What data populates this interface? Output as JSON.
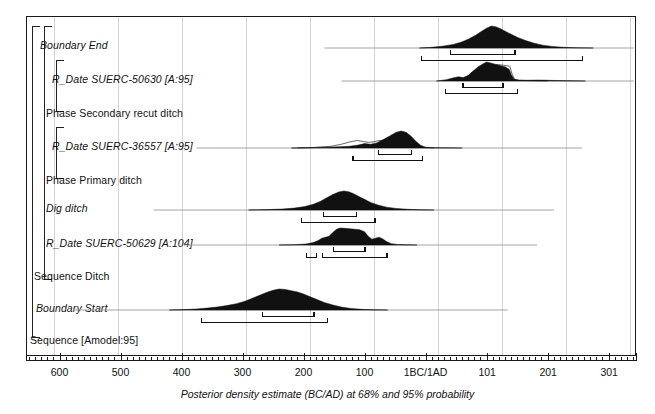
{
  "chart_data": {
    "type": "area",
    "title": "",
    "xlabel": "Posterior density estimate (BC/AD) at 68% and 95% probability",
    "ylabel": "",
    "axis": {
      "orientation": "reversed-bc-to-ad",
      "tick_labels": [
        "600",
        "500",
        "400",
        "300",
        "200",
        "100",
        "1BC/1AD",
        "101",
        "201",
        "301"
      ],
      "tick_values": [
        -600,
        -500,
        -400,
        -300,
        -200,
        -100,
        0,
        101,
        201,
        301
      ],
      "minor_tick_step": 10,
      "x_min": -655,
      "x_max": 345,
      "grid": true
    },
    "legend": {
      "position": "none",
      "entries": []
    },
    "rows": [
      {
        "id": "boundary-end",
        "label": "Boundary End",
        "style": "italic",
        "kind": "boundary",
        "density": [
          [
            -10,
            0
          ],
          [
            10,
            0.03
          ],
          [
            30,
            0.09
          ],
          [
            45,
            0.16
          ],
          [
            58,
            0.26
          ],
          [
            70,
            0.4
          ],
          [
            82,
            0.58
          ],
          [
            92,
            0.76
          ],
          [
            100,
            0.9
          ],
          [
            108,
            1.0
          ],
          [
            116,
            0.96
          ],
          [
            124,
            0.86
          ],
          [
            132,
            0.74
          ],
          [
            142,
            0.6
          ],
          [
            152,
            0.47
          ],
          [
            164,
            0.34
          ],
          [
            178,
            0.22
          ],
          [
            192,
            0.13
          ],
          [
            208,
            0.07
          ],
          [
            226,
            0.03
          ],
          [
            248,
            0.01
          ],
          [
            275,
            0.0
          ]
        ],
        "range68": [
          [
            40,
            148
          ]
        ],
        "range95": [
          [
            -8,
            258
          ]
        ]
      },
      {
        "id": "r-date-suerc-50630",
        "label": "R_Date SUERC-50630 [A:95]",
        "style": "italic",
        "kind": "r_date",
        "density": [
          [
            18,
            0
          ],
          [
            34,
            0.07
          ],
          [
            46,
            0.17
          ],
          [
            54,
            0.22
          ],
          [
            62,
            0.18
          ],
          [
            70,
            0.3
          ],
          [
            78,
            0.52
          ],
          [
            86,
            0.74
          ],
          [
            94,
            0.9
          ],
          [
            100,
            1.0
          ],
          [
            108,
            0.94
          ],
          [
            116,
            0.86
          ],
          [
            124,
            0.8
          ],
          [
            131,
            0.74
          ],
          [
            137,
            0.62
          ],
          [
            141,
            0.3
          ],
          [
            145,
            0.1
          ],
          [
            152,
            0.05
          ],
          [
            168,
            0.04
          ],
          [
            186,
            0.05
          ],
          [
            200,
            0.04
          ],
          [
            218,
            0.02
          ],
          [
            240,
            0.01
          ],
          [
            262,
            0
          ]
        ],
        "prior_outline": [
          [
            60,
            0
          ],
          [
            70,
            0.25
          ],
          [
            80,
            0.5
          ],
          [
            90,
            0.72
          ],
          [
            100,
            0.86
          ],
          [
            110,
            0.88
          ],
          [
            120,
            0.86
          ],
          [
            130,
            0.82
          ],
          [
            138,
            0.78
          ],
          [
            142,
            0.36
          ],
          [
            146,
            0.08
          ],
          [
            154,
            0.03
          ],
          [
            170,
            0.02
          ],
          [
            200,
            0
          ]
        ],
        "range68": [
          [
            60,
            128
          ]
        ],
        "range95": [
          [
            32,
            152
          ]
        ]
      },
      {
        "id": "phase-secondary-recut-ditch",
        "label": "Phase Secondary recut ditch",
        "style": "plain",
        "kind": "group",
        "density": [],
        "range68": [],
        "range95": []
      },
      {
        "id": "r-date-suerc-36557",
        "label": "R_Date SUERC-36557 [A:95]",
        "style": "italic",
        "kind": "r_date",
        "density": [
          [
            -220,
            0
          ],
          [
            -190,
            0.02
          ],
          [
            -160,
            0.05
          ],
          [
            -140,
            0.08
          ],
          [
            -125,
            0.1
          ],
          [
            -112,
            0.16
          ],
          [
            -100,
            0.26
          ],
          [
            -90,
            0.22
          ],
          [
            -80,
            0.3
          ],
          [
            -70,
            0.48
          ],
          [
            -58,
            0.72
          ],
          [
            -48,
            0.92
          ],
          [
            -40,
            1.0
          ],
          [
            -32,
            0.92
          ],
          [
            -24,
            0.7
          ],
          [
            -16,
            0.4
          ],
          [
            -8,
            0.16
          ],
          [
            0,
            0.05
          ],
          [
            12,
            0.02
          ],
          [
            30,
            0.01
          ],
          [
            60,
            0
          ]
        ],
        "prior_outline": [
          [
            -210,
            0
          ],
          [
            -180,
            0.04
          ],
          [
            -155,
            0.1
          ],
          [
            -138,
            0.22
          ],
          [
            -124,
            0.36
          ],
          [
            -112,
            0.44
          ],
          [
            -102,
            0.38
          ],
          [
            -94,
            0.33
          ],
          [
            -86,
            0.36
          ],
          [
            -78,
            0.42
          ],
          [
            -70,
            0.46
          ],
          [
            -60,
            0.44
          ],
          [
            -52,
            0.4
          ],
          [
            -44,
            0.36
          ],
          [
            -36,
            0.26
          ],
          [
            -28,
            0.18
          ],
          [
            -18,
            0.09
          ],
          [
            -6,
            0.03
          ],
          [
            14,
            0
          ]
        ],
        "range68": [
          [
            -78,
            -22
          ]
        ],
        "range95": [
          [
            -120,
            -4
          ]
        ]
      },
      {
        "id": "phase-primary-ditch",
        "label": "Phase Primary ditch",
        "style": "plain",
        "kind": "group",
        "density": [],
        "range68": [],
        "range95": []
      },
      {
        "id": "dig-ditch",
        "label": "Dig ditch",
        "style": "italic",
        "kind": "event",
        "density": [
          [
            -290,
            0
          ],
          [
            -260,
            0.02
          ],
          [
            -235,
            0.05
          ],
          [
            -215,
            0.1
          ],
          [
            -198,
            0.18
          ],
          [
            -184,
            0.3
          ],
          [
            -172,
            0.46
          ],
          [
            -162,
            0.64
          ],
          [
            -152,
            0.82
          ],
          [
            -142,
            0.95
          ],
          [
            -134,
            1.0
          ],
          [
            -126,
            0.96
          ],
          [
            -118,
            0.86
          ],
          [
            -110,
            0.72
          ],
          [
            -100,
            0.56
          ],
          [
            -90,
            0.4
          ],
          [
            -78,
            0.26
          ],
          [
            -64,
            0.15
          ],
          [
            -48,
            0.08
          ],
          [
            -30,
            0.04
          ],
          [
            -8,
            0.01
          ],
          [
            14,
            0
          ]
        ],
        "range68": [
          [
            -168,
            -112
          ]
        ],
        "range95": [
          [
            -205,
            -82
          ]
        ]
      },
      {
        "id": "r-date-suerc-50629",
        "label": "R_Date SUERC-50629 [A:104]",
        "style": "italic",
        "kind": "r_date",
        "density": [
          [
            -240,
            0
          ],
          [
            -215,
            0.02
          ],
          [
            -196,
            0.06
          ],
          [
            -184,
            0.14
          ],
          [
            -176,
            0.26
          ],
          [
            -170,
            0.4
          ],
          [
            -164,
            0.46
          ],
          [
            -158,
            0.52
          ],
          [
            -152,
            0.74
          ],
          [
            -146,
            0.92
          ],
          [
            -140,
            1.0
          ],
          [
            -132,
            0.98
          ],
          [
            -124,
            0.95
          ],
          [
            -116,
            0.93
          ],
          [
            -108,
            0.9
          ],
          [
            -100,
            0.78
          ],
          [
            -94,
            0.52
          ],
          [
            -88,
            0.34
          ],
          [
            -82,
            0.4
          ],
          [
            -76,
            0.46
          ],
          [
            -70,
            0.36
          ],
          [
            -64,
            0.2
          ],
          [
            -56,
            0.08
          ],
          [
            -46,
            0.03
          ],
          [
            -32,
            0.01
          ],
          [
            -14,
            0
          ]
        ],
        "range68": [
          [
            -152,
            -98
          ]
        ],
        "range95": [
          [
            -196,
            -178
          ],
          [
            -170,
            -62
          ]
        ]
      },
      {
        "id": "sequence-ditch",
        "label": "Sequence Ditch",
        "style": "plain",
        "kind": "group",
        "density": [],
        "range68": [],
        "range95": []
      },
      {
        "id": "boundary-start",
        "label": "Boundary Start",
        "style": "italic",
        "kind": "boundary",
        "density": [
          [
            -420,
            0
          ],
          [
            -395,
            0.02
          ],
          [
            -375,
            0.05
          ],
          [
            -358,
            0.09
          ],
          [
            -342,
            0.14
          ],
          [
            -326,
            0.21
          ],
          [
            -310,
            0.3
          ],
          [
            -296,
            0.42
          ],
          [
            -284,
            0.56
          ],
          [
            -272,
            0.7
          ],
          [
            -260,
            0.84
          ],
          [
            -250,
            0.94
          ],
          [
            -240,
            1.0
          ],
          [
            -230,
            0.98
          ],
          [
            -220,
            0.92
          ],
          [
            -210,
            0.86
          ],
          [
            -200,
            0.76
          ],
          [
            -190,
            0.64
          ],
          [
            -178,
            0.5
          ],
          [
            -166,
            0.36
          ],
          [
            -152,
            0.24
          ],
          [
            -138,
            0.14
          ],
          [
            -122,
            0.07
          ],
          [
            -104,
            0.03
          ],
          [
            -84,
            0.01
          ],
          [
            -62,
            0
          ]
        ],
        "range68": [
          [
            -268,
            -182
          ]
        ],
        "range95": [
          [
            -368,
            -160
          ]
        ]
      },
      {
        "id": "sequence-amodel",
        "label": "Sequence [Amodel:95]",
        "style": "plain",
        "kind": "group",
        "density": [],
        "range68": [],
        "range95": []
      }
    ],
    "brackets": [
      {
        "id": "bracket-sequence-outer",
        "label_ref": "sequence-amodel"
      },
      {
        "id": "bracket-sequence-ditch",
        "label_ref": "sequence-ditch"
      },
      {
        "id": "bracket-phase-secondary",
        "label_ref": "phase-secondary-recut-ditch"
      },
      {
        "id": "bracket-phase-primary",
        "label_ref": "phase-primary-ditch"
      }
    ]
  },
  "colors": {
    "density_fill": "#111111",
    "prior_outline": "#555555",
    "baseline": "#9a9a9a",
    "grid": "#d2d2d2",
    "frame": "#1b1b1b",
    "text": "#111111"
  }
}
